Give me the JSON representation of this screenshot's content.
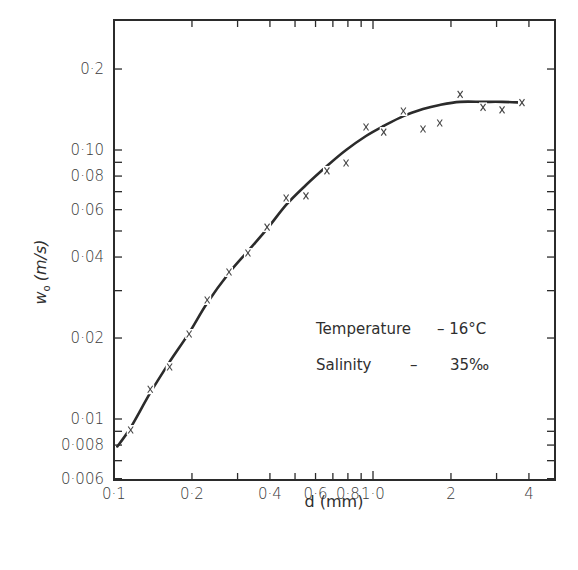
{
  "chart_data": {
    "type": "scatter",
    "title": "",
    "xlabel": "d (mm)",
    "ylabel": "w₀ (m/s)",
    "xscale": "log",
    "yscale": "log",
    "xlim": [
      0.1,
      4.8
    ],
    "ylim": [
      0.0059,
      0.32
    ],
    "grid": false,
    "x_ticks": [
      {
        "value": 0.1,
        "label": "0·1"
      },
      {
        "value": 0.2,
        "label": "0·2"
      },
      {
        "value": 0.4,
        "label": "0·4"
      },
      {
        "value": 0.6,
        "label": "0·6"
      },
      {
        "value": 0.8,
        "label": "0·8"
      },
      {
        "value": 1.0,
        "label": "1·0"
      },
      {
        "value": 2,
        "label": "2"
      },
      {
        "value": 4,
        "label": "4"
      }
    ],
    "x_minor_ticks": [
      0.3,
      0.5,
      0.7,
      0.9,
      3
    ],
    "y_ticks": [
      {
        "value": 0.2,
        "label": "0·2"
      },
      {
        "value": 0.1,
        "label": "0·10"
      },
      {
        "value": 0.08,
        "label": "0·08"
      },
      {
        "value": 0.06,
        "label": "0·06"
      },
      {
        "value": 0.04,
        "label": "0·04"
      },
      {
        "value": 0.02,
        "label": "0·02"
      },
      {
        "value": 0.01,
        "label": "0·01"
      },
      {
        "value": 0.008,
        "label": "0·008"
      },
      {
        "value": 0.006,
        "label": "0·006"
      }
    ],
    "y_minor_ticks": [
      0.09,
      0.07,
      0.05,
      0.03,
      0.009,
      0.007
    ],
    "legend": {
      "position": "lower right inside",
      "lines": [
        {
          "label": "Temperature",
          "dash": "–",
          "value": "16°C"
        },
        {
          "label": "Salinity",
          "dash": "–",
          "value": "35‰"
        }
      ]
    },
    "series": [
      {
        "name": "measured",
        "kind": "scatter",
        "marker": "x",
        "x": [
          0.116,
          0.138,
          0.164,
          0.195,
          0.229,
          0.278,
          0.329,
          0.39,
          0.462,
          0.551,
          0.664,
          0.787,
          0.94,
          1.1,
          1.31,
          1.56,
          1.81,
          2.17,
          2.66,
          3.15,
          3.76
        ],
        "y": [
          0.0091,
          0.0129,
          0.0156,
          0.0207,
          0.0277,
          0.0352,
          0.0414,
          0.0517,
          0.0663,
          0.0675,
          0.0836,
          0.0895,
          0.1218,
          0.1166,
          0.1396,
          0.1197,
          0.126,
          0.161,
          0.144,
          0.141,
          0.15
        ]
      },
      {
        "name": "fitted curve",
        "kind": "line",
        "x": [
          0.103,
          0.116,
          0.138,
          0.164,
          0.195,
          0.229,
          0.278,
          0.329,
          0.39,
          0.462,
          0.551,
          0.664,
          0.787,
          0.94,
          1.1,
          1.31,
          1.56,
          1.81,
          2.17,
          2.66,
          3.15,
          3.76
        ],
        "y": [
          0.0079,
          0.0093,
          0.0125,
          0.0163,
          0.0209,
          0.027,
          0.0349,
          0.0421,
          0.0509,
          0.0625,
          0.0741,
          0.0872,
          0.1,
          0.1127,
          0.1228,
          0.1337,
          0.142,
          0.147,
          0.151,
          0.151,
          0.151,
          0.15
        ]
      }
    ]
  },
  "axes": {
    "xlabel": "d (mm)",
    "ylabel_main": "w",
    "ylabel_sub": "o",
    "ylabel_units": "(m/s)"
  },
  "legend": {
    "temperature_label": "Temperature",
    "temperature_value": "– 16°C",
    "salinity_label": "Salinity",
    "salinity_dash": "–",
    "salinity_value": "35‰"
  },
  "style": {
    "ink": "#2b2b2b",
    "background": "#ffffff"
  }
}
